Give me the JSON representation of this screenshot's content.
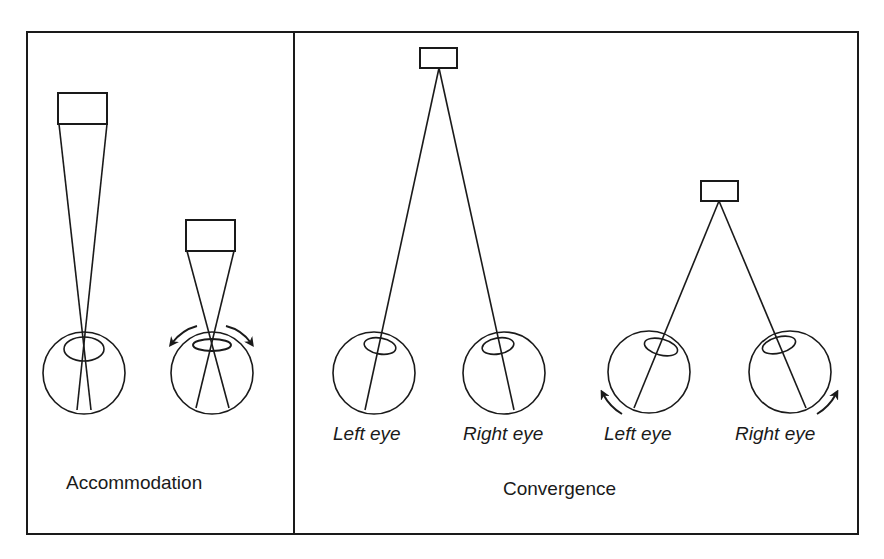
{
  "figure": {
    "panels": [
      {
        "id": "accommodation",
        "title": "Accommodation",
        "items": [
          {
            "name": "far-target",
            "description": "Distant object with narrow light cone converging on eye"
          },
          {
            "name": "near-target",
            "description": "Near object with wide light cone; lens bulges (curved arrows)"
          }
        ]
      },
      {
        "id": "convergence",
        "title": "Convergence",
        "groups": [
          {
            "name": "far-fixation",
            "eye_labels": [
              "Left eye",
              "Right eye"
            ]
          },
          {
            "name": "near-fixation",
            "eye_labels": [
              "Left eye",
              "Right eye"
            ],
            "note": "eyes rotate inward (curved arrows)"
          }
        ]
      }
    ],
    "colors": {
      "stroke": "#1a1a1a",
      "background": "#ffffff"
    }
  }
}
